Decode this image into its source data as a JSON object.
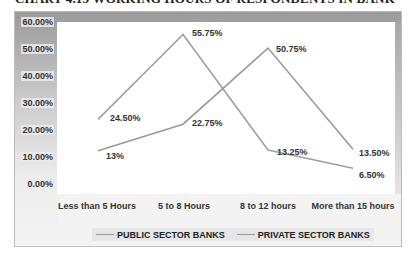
{
  "chart_data": {
    "type": "line",
    "title": "CHART 4.15 WORKING HOURS OF RESPONDENTS IN BANK",
    "xlabel": "",
    "ylabel": "",
    "categories": [
      "Less than 5 Hours",
      "5 to 8 Hours",
      "8 to 12 hours",
      "More than 15 hours"
    ],
    "series": [
      {
        "name": "PUBLIC SECTOR BANKS",
        "values": [
          24.5,
          55.75,
          13.25,
          6.5
        ],
        "labels": [
          "24.50%",
          "55.75%",
          "13.25%",
          "6.50%"
        ],
        "color": "#a0a0a0"
      },
      {
        "name": "PRIVATE SECTOR BANKS",
        "values": [
          13.0,
          22.75,
          50.75,
          13.5
        ],
        "labels": [
          "13%",
          "22.75%",
          "50.75%",
          "13.50%"
        ],
        "color": "#9a9a9a"
      }
    ],
    "ylim": [
      0,
      60
    ],
    "yticks": [
      "0.00%",
      "10.00%",
      "20.00%",
      "30.00%",
      "40.00%",
      "50.00%",
      "60.00%"
    ],
    "grid": false,
    "legend_position": "bottom"
  }
}
